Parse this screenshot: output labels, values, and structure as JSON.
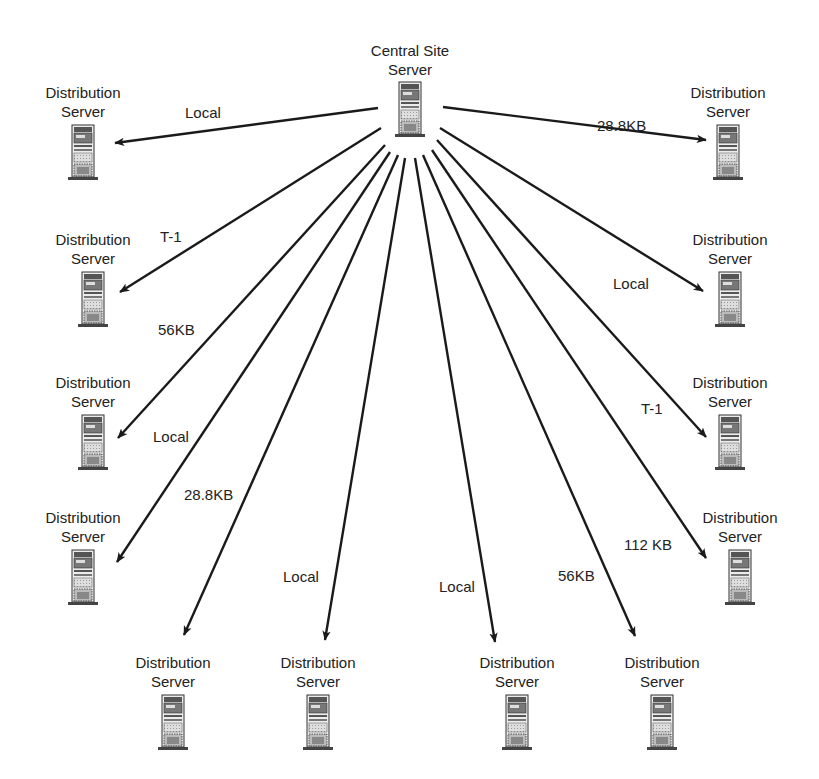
{
  "diagram": {
    "type": "hub-and-spoke network topology",
    "hub": {
      "label_line1": "Central Site",
      "label_line2": "Server",
      "icon": "server-tower-icon",
      "x": 410,
      "y": 100
    },
    "nodes": [
      {
        "id": "ds-top-left",
        "line1": "Distribution",
        "line2": "Server",
        "x": 83,
        "y": 143,
        "link_label": "Local",
        "lx": 185,
        "ly": 118,
        "ax1": 378,
        "ay1": 108,
        "ax2": 115,
        "ay2": 143
      },
      {
        "id": "ds-top-right",
        "line1": "Distribution",
        "line2": "Server",
        "x": 728,
        "y": 143,
        "link_label": "28.8KB",
        "lx": 597,
        "ly": 131,
        "ax1": 443,
        "ay1": 107,
        "ax2": 706,
        "ay2": 140
      },
      {
        "id": "ds-left-2",
        "line1": "Distribution",
        "line2": "Server",
        "x": 93,
        "y": 290,
        "link_label": "T-1",
        "lx": 160,
        "ly": 242,
        "ax1": 381,
        "ay1": 128,
        "ax2": 120,
        "ay2": 292
      },
      {
        "id": "ds-left-3",
        "line1": "Distribution",
        "line2": "Server",
        "x": 93,
        "y": 433,
        "link_label": "56KB",
        "lx": 158,
        "ly": 335,
        "ax1": 385,
        "ay1": 145,
        "ax2": 118,
        "ay2": 438
      },
      {
        "id": "ds-left-4",
        "line1": "Distribution",
        "line2": "Server",
        "x": 83,
        "y": 568,
        "link_label": "Local",
        "lx": 153,
        "ly": 442,
        "ax1": 390,
        "ay1": 152,
        "ax2": 117,
        "ay2": 562
      },
      {
        "id": "ds-bottom-1",
        "line1": "Distribution",
        "line2": "Server",
        "x": 173,
        "y": 713,
        "link_label": "28.8KB",
        "lx": 184,
        "ly": 500,
        "ax1": 398,
        "ay1": 155,
        "ax2": 184,
        "ay2": 635
      },
      {
        "id": "ds-bottom-2",
        "line1": "Distribution",
        "line2": "Server",
        "x": 318,
        "y": 713,
        "link_label": "Local",
        "lx": 283,
        "ly": 582,
        "ax1": 405,
        "ay1": 158,
        "ax2": 325,
        "ay2": 640
      },
      {
        "id": "ds-bottom-3",
        "line1": "Distribution",
        "line2": "Server",
        "x": 517,
        "y": 713,
        "link_label": "Local",
        "lx": 439,
        "ly": 592,
        "ax1": 415,
        "ay1": 158,
        "ax2": 495,
        "ay2": 642
      },
      {
        "id": "ds-bottom-4",
        "line1": "Distribution",
        "line2": "Server",
        "x": 662,
        "y": 713,
        "link_label": "56KB",
        "lx": 558,
        "ly": 581,
        "ax1": 423,
        "ay1": 155,
        "ax2": 635,
        "ay2": 636
      },
      {
        "id": "ds-right-4",
        "line1": "Distribution",
        "line2": "Server",
        "x": 740,
        "y": 568,
        "link_label": "112 KB",
        "lx": 624,
        "ly": 550,
        "ax1": 432,
        "ay1": 150,
        "ax2": 706,
        "ay2": 558
      },
      {
        "id": "ds-right-3",
        "line1": "Distribution",
        "line2": "Server",
        "x": 730,
        "y": 433,
        "link_label": "T-1",
        "lx": 641,
        "ly": 414,
        "ax1": 437,
        "ay1": 140,
        "ax2": 706,
        "ay2": 437
      },
      {
        "id": "ds-right-2",
        "line1": "Distribution",
        "line2": "Server",
        "x": 730,
        "y": 290,
        "link_label": "Local",
        "lx": 613,
        "ly": 289,
        "ax1": 440,
        "ay1": 128,
        "ax2": 703,
        "ay2": 291
      }
    ],
    "colors": {
      "line": "#1a1a1a",
      "text": "#222222",
      "server_body": "#e6e6e6",
      "server_stipple": "#c8c8c8",
      "server_dark": "#555555"
    }
  }
}
